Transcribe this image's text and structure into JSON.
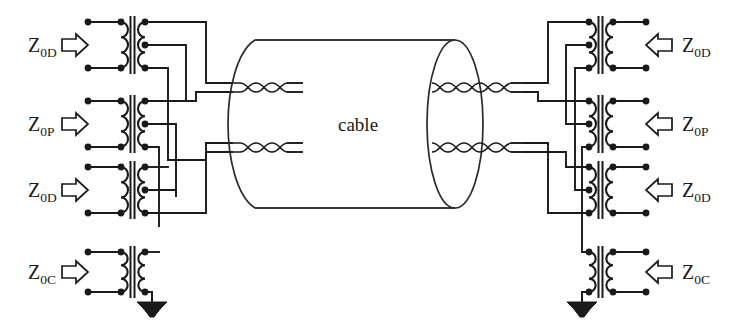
{
  "figure": {
    "background_color": "#ffffff",
    "line_color": "#1a1a1a",
    "width": 734,
    "height": 325
  },
  "cable": {
    "label": "cable",
    "shape": "cylinder",
    "pairs_entering": 2,
    "pairs_exiting": 2
  },
  "left_ports": [
    {
      "id": "left-1",
      "label_z": "Z",
      "label_sub": "0D",
      "arrow": "right-arrow-icon",
      "mode": "differential"
    },
    {
      "id": "left-2",
      "label_z": "Z",
      "label_sub": "0P",
      "arrow": "right-arrow-icon",
      "mode": "pair"
    },
    {
      "id": "left-3",
      "label_z": "Z",
      "label_sub": "0D",
      "arrow": "right-arrow-icon",
      "mode": "differential"
    },
    {
      "id": "left-4",
      "label_z": "Z",
      "label_sub": "0C",
      "arrow": "right-arrow-icon",
      "mode": "common"
    }
  ],
  "right_ports": [
    {
      "id": "right-1",
      "label_z": "Z",
      "label_sub": "0D",
      "arrow": "left-arrow-icon",
      "mode": "differential"
    },
    {
      "id": "right-2",
      "label_z": "Z",
      "label_sub": "0P",
      "arrow": "left-arrow-icon",
      "mode": "pair"
    },
    {
      "id": "right-3",
      "label_z": "Z",
      "label_sub": "0D",
      "arrow": "left-arrow-icon",
      "mode": "differential"
    },
    {
      "id": "right-4",
      "label_z": "Z",
      "label_sub": "0C",
      "arrow": "left-arrow-icon",
      "mode": "common"
    }
  ],
  "grounds": [
    {
      "id": "ground-left",
      "symbol": "ground-icon"
    },
    {
      "id": "ground-right",
      "symbol": "ground-icon"
    }
  ],
  "transformers": {
    "count": 8,
    "primary_taps": 2,
    "secondary_taps": 3,
    "symbol": "transformer-icon"
  }
}
